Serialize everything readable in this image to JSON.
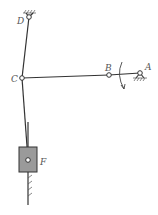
{
  "diagram": {
    "type": "planar-linkage-mechanism",
    "labels": {
      "A": "A",
      "B": "B",
      "C": "C",
      "D": "D",
      "F": "F"
    },
    "joints": [
      {
        "id": "A",
        "kind": "fixed-pivot",
        "x": 140,
        "y": 73
      },
      {
        "id": "B",
        "kind": "revolute",
        "x": 109,
        "y": 75
      },
      {
        "id": "C",
        "kind": "revolute",
        "x": 22,
        "y": 78
      },
      {
        "id": "D",
        "kind": "fixed-pivot",
        "x": 29,
        "y": 17
      },
      {
        "id": "F",
        "kind": "slider",
        "x": 28,
        "y": 160
      }
    ],
    "links": [
      {
        "from": "A",
        "to": "B",
        "name": "crank-AB"
      },
      {
        "from": "B",
        "to": "C",
        "name": "coupler-BC"
      },
      {
        "from": "D",
        "to": "C",
        "name": "rocker-DC"
      },
      {
        "from": "C",
        "to": "F",
        "name": "connecting-rod-CF"
      }
    ],
    "rotation": {
      "at": "A",
      "direction": "clockwise"
    },
    "colors": {
      "line": "#333333",
      "slider_fill": "#9a9a9a",
      "ground_hatch": "#555555"
    }
  }
}
